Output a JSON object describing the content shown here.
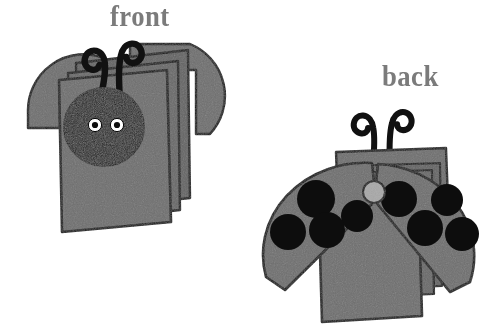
{
  "illustration": {
    "title": "Ladybug folded card craft - front and back views",
    "background_color": "#ffffff",
    "body_gray": "#6e6e6e",
    "outline_black": "#111111",
    "head_black": "#1a1a1a",
    "eye_white": "#ffffff",
    "label_gray": "#7b7b7b",
    "spot_black": "#0d0d0d",
    "center_dot_gray": "#a6a6a6"
  },
  "labels": {
    "front": "front",
    "back": "back"
  },
  "front_view": {
    "name": "front-ladybug-card",
    "parts": {
      "left_wing": "left-wing",
      "right_wing": "right-wing",
      "card_pages": "stacked-card-pages",
      "head": "ladybug-head",
      "left_eye": "left-eye",
      "right_eye": "right-eye",
      "left_antenna": "left-antenna",
      "right_antenna": "right-antenna"
    },
    "page_count": 3,
    "eye_count": 2,
    "antenna_count": 2
  },
  "back_view": {
    "name": "back-ladybug-card",
    "parts": {
      "body_panel": "body-panel",
      "card_pages": "stacked-card-pages",
      "left_wing": "left-wing",
      "right_wing": "right-wing",
      "center_dot": "center-pivot-dot",
      "left_antenna": "left-antenna",
      "right_antenna": "right-antenna"
    },
    "left_wing_spot_count": 4,
    "right_wing_spot_count": 4,
    "total_spot_count": 8,
    "antenna_count": 2
  }
}
